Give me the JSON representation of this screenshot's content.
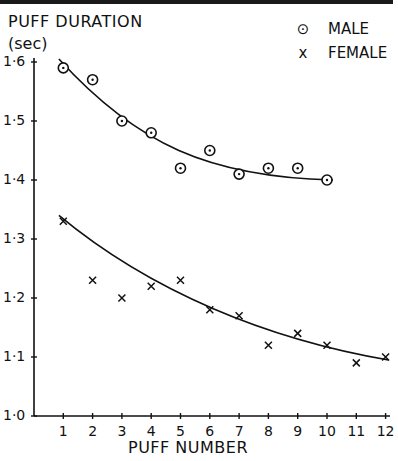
{
  "chart_data": {
    "type": "scatter",
    "title": "PUFF DURATION",
    "ylabel": "PUFF DURATION (sec)",
    "ylabel_unit": "(sec)",
    "xlabel": "PUFF NUMBER",
    "x": [
      1,
      2,
      3,
      4,
      5,
      6,
      7,
      8,
      9,
      10,
      11,
      12
    ],
    "xticks": [
      "1",
      "2",
      "3",
      "4",
      "5",
      "6",
      "7",
      "8",
      "9",
      "10",
      "11",
      "12"
    ],
    "yticks": [
      "1·0",
      "1·1",
      "1·2",
      "1·3",
      "1·4",
      "1·5",
      "1·6"
    ],
    "ylim": [
      1.0,
      1.6
    ],
    "xlim": [
      0,
      12
    ],
    "grid": false,
    "legend_position": "top-right",
    "series": [
      {
        "name": "MALE",
        "marker": "circle-dot",
        "x": [
          1,
          2,
          3,
          4,
          5,
          6,
          7,
          8,
          9,
          10
        ],
        "values": [
          1.59,
          1.57,
          1.5,
          1.48,
          1.42,
          1.45,
          1.41,
          1.42,
          1.42,
          1.4
        ],
        "fit_curve": true
      },
      {
        "name": "FEMALE",
        "marker": "x",
        "x": [
          1,
          2,
          3,
          4,
          5,
          6,
          7,
          8,
          9,
          10,
          11,
          12
        ],
        "values": [
          1.33,
          1.23,
          1.2,
          1.22,
          1.23,
          1.18,
          1.17,
          1.12,
          1.14,
          1.12,
          1.09,
          1.1
        ],
        "fit_curve": true
      }
    ]
  },
  "labels": {
    "title": "PUFF DURATION",
    "unit": "(sec)",
    "xlabel": "PUFF NUMBER",
    "legend_male": "MALE",
    "legend_female": "FEMALE",
    "legend_male_symbol": "⊙",
    "legend_female_symbol": "x"
  }
}
